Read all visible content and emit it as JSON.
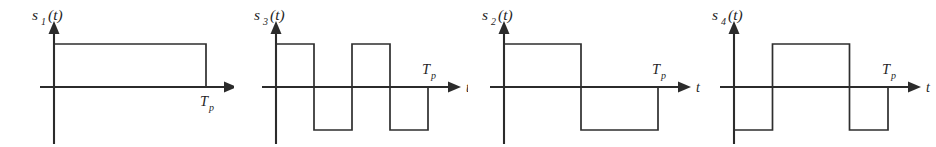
{
  "figure": {
    "background_color": "#ffffff",
    "line_color": "#2e2e2e",
    "axis_color": "#2b2b2b",
    "panel_count": 4,
    "time_axis_label": "t",
    "period_label": "T",
    "period_subscript": "p"
  },
  "chart_data": {
    "type": "line",
    "xlabel": "t",
    "ylabel": "",
    "xlim": [
      0,
      1
    ],
    "ylim": [
      -1,
      1
    ],
    "grid": false,
    "legend": "none",
    "x_tick_labels": [
      "T_p"
    ],
    "x_tick_values": [
      1
    ],
    "note": "Each panel plots one bipolar square-wave signal over a single period T_p; amplitude levels are +1 and -1.",
    "series": [
      {
        "name": "s1(t)",
        "panel": 0,
        "segment_count": 1,
        "levels": [
          1
        ],
        "breakpoints": [
          0,
          1
        ],
        "x": [
          0,
          1
        ],
        "values": [
          1,
          1
        ]
      },
      {
        "name": "s3(t)",
        "panel": 1,
        "segment_count": 4,
        "levels": [
          1,
          -1,
          1,
          -1
        ],
        "breakpoints": [
          0,
          0.25,
          0.5,
          0.75,
          1
        ],
        "x": [
          0,
          0.25,
          0.5,
          0.75,
          1
        ],
        "values": [
          1,
          -1,
          1,
          -1,
          -1
        ]
      },
      {
        "name": "s2(t)",
        "panel": 2,
        "segment_count": 2,
        "levels": [
          1,
          -1
        ],
        "breakpoints": [
          0,
          0.5,
          1
        ],
        "x": [
          0,
          0.5,
          1
        ],
        "values": [
          1,
          -1,
          -1
        ]
      },
      {
        "name": "s4(t)",
        "panel": 3,
        "segment_count": 3,
        "levels": [
          -1,
          1,
          -1
        ],
        "breakpoints": [
          0,
          0.25,
          0.75,
          1
        ],
        "x": [
          0,
          0.25,
          0.75,
          1
        ],
        "values": [
          -1,
          1,
          -1,
          -1
        ]
      }
    ]
  },
  "panels": [
    {
      "id": "panel-s1",
      "signal_base": "s",
      "signal_index": "1",
      "signal_arg": "(t)",
      "signal_label": "s1(t)",
      "axis_label": "t",
      "period_label": "T",
      "period_subscript": "p",
      "period_label_position": "below-axis"
    },
    {
      "id": "panel-s3",
      "signal_base": "s",
      "signal_index": "3",
      "signal_arg": "(t)",
      "signal_label": "s3(t)",
      "axis_label": "t",
      "period_label": "T",
      "period_subscript": "p",
      "period_label_position": "above-axis"
    },
    {
      "id": "panel-s2",
      "signal_base": "s",
      "signal_index": "2",
      "signal_arg": "(t)",
      "signal_label": "s2(t)",
      "axis_label": "t",
      "period_label": "T",
      "period_subscript": "p",
      "period_label_position": "above-axis"
    },
    {
      "id": "panel-s4",
      "signal_base": "s",
      "signal_index": "4",
      "signal_arg": "(t)",
      "signal_label": "s4(t)",
      "axis_label": "t",
      "period_label": "T",
      "period_subscript": "p",
      "period_label_position": "above-axis"
    }
  ],
  "geometry": {
    "panel_width": 234,
    "panel_height": 147,
    "baseline_y": 87,
    "high_y": 44,
    "low_y": 130,
    "y_axis_x_offsets": [
      54,
      42,
      36,
      32
    ],
    "trace_start_offsets": [
      54,
      42,
      36,
      32
    ],
    "trace_end_offsets": [
      206,
      194,
      190,
      186
    ],
    "axis_end_offsets": [
      224,
      214,
      210,
      206
    ],
    "y_axis_top": 30,
    "y_axis_bottom": 144
  }
}
